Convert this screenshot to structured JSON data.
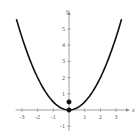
{
  "chart_data": {
    "type": "line",
    "title": "",
    "xlabel": "x",
    "ylabel": "y",
    "xlim": [
      -3.4,
      3.5
    ],
    "ylim": [
      -1.3,
      5.8
    ],
    "xticks": [
      -3,
      -2,
      -1,
      1,
      2,
      3
    ],
    "yticks": [
      -1,
      1,
      2,
      3,
      4,
      5
    ],
    "xtick_labels": [
      "-3",
      "-2",
      "-1",
      "1",
      "2",
      "3"
    ],
    "ytick_labels": [
      "-1",
      "1",
      "2",
      "3",
      "4",
      "5"
    ],
    "grid": false,
    "legend": null,
    "series": [
      {
        "name": "y = x^2/2",
        "function": "0.5*x^2",
        "x_range": [
          -3.35,
          3.35
        ],
        "color": "#111111"
      }
    ],
    "points": [
      {
        "x": 0,
        "y": 0,
        "filled": true
      },
      {
        "x": 0,
        "y": 0.5,
        "filled": true
      }
    ]
  },
  "axes": {
    "x_label": "x",
    "y_label": "y"
  }
}
